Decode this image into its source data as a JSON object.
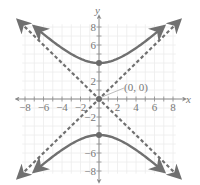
{
  "chart_data": {
    "type": "line",
    "title": "",
    "xlabel": "x",
    "ylabel": "y",
    "xlim": [
      -8,
      8
    ],
    "ylim": [
      -8,
      8
    ],
    "grid": true,
    "x_ticks": [
      -8,
      -6,
      -4,
      -2,
      2,
      4,
      6,
      8
    ],
    "y_ticks": [
      8,
      6,
      2,
      -2,
      -6,
      -8
    ],
    "x_tick_labels": [
      "−8",
      "−6",
      "−4",
      "−2",
      "2",
      "4",
      "6",
      "8"
    ],
    "y_tick_labels": [
      "8",
      "6",
      "2",
      "−2",
      "−6",
      "−8"
    ],
    "series": [
      {
        "name": "hyperbola",
        "equation": "y^2/16 - x^2/16 = 1",
        "style": "solid",
        "color": "#707070",
        "vertices": [
          [
            0,
            4
          ],
          [
            0,
            -4
          ]
        ]
      },
      {
        "name": "asymptote y = x",
        "style": "dashed",
        "color": "#707070",
        "points": [
          [
            -8.5,
            -8.5
          ],
          [
            8.5,
            8.5
          ]
        ]
      },
      {
        "name": "asymptote y = -x",
        "style": "dashed",
        "color": "#707070",
        "points": [
          [
            -8.5,
            8.5
          ],
          [
            8.5,
            -8.5
          ]
        ]
      }
    ],
    "annotations": [
      {
        "text": "(0, 0)",
        "x": 0,
        "y": 0
      }
    ],
    "marked_points": [
      [
        0,
        4
      ],
      [
        0,
        -4
      ],
      [
        0,
        0
      ]
    ]
  },
  "labels": {
    "x_axis": "x",
    "y_axis": "y",
    "center": "(0, 0)",
    "ticks_x": [
      "−8",
      "−6",
      "−4",
      "−2",
      "2",
      "4",
      "6",
      "8"
    ],
    "ticks_y": [
      "8",
      "6",
      "2",
      "−2",
      "−6",
      "−8"
    ]
  },
  "colors": {
    "curve": "#707070",
    "grid": "#ececec",
    "axis": "#8a8a8a",
    "text": "#777777"
  }
}
